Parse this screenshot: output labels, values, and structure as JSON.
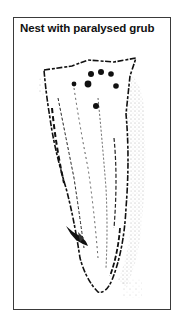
{
  "figure": {
    "title": "Nest with paralysed grub",
    "illustration": {
      "subject": "stippled ink drawing of a hollow stem/wood nest with entrance holes and a paralysed grub",
      "ink_color": "#111111",
      "stipple_color": "#555555"
    },
    "frame_color": "#3a3a3a"
  }
}
